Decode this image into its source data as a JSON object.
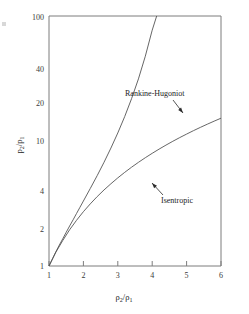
{
  "chart_data": {
    "type": "line",
    "title": "",
    "subtitle": "",
    "xlabel": "ρ₂/ρ₁",
    "ylabel": "p₂/p₁",
    "xscale": "linear",
    "yscale": "log",
    "xlim": [
      1,
      6
    ],
    "ylim": [
      1,
      100
    ],
    "grid": false,
    "legend_position": "inline-annotations",
    "xticks": [
      1,
      2,
      3,
      4,
      5,
      6
    ],
    "xtick_labels": [
      "1",
      "2",
      "3",
      "4",
      "5",
      "6"
    ],
    "yticks": [
      1,
      2,
      4,
      10,
      20,
      40,
      100
    ],
    "ytick_labels": [
      "1",
      "2",
      "4",
      "10",
      "20",
      "40",
      "100"
    ],
    "annotations": [
      {
        "name": "rankine-hugoniot-annotation",
        "text": "Rankine-Hugoniot",
        "points_to_x": 4.05,
        "points_to_y": 19.0
      },
      {
        "name": "isentropic-annotation",
        "text": "Isentropic",
        "points_to_x": 3.05,
        "points_to_y": 4.6
      }
    ],
    "series": [
      {
        "name": "Rankine-Hugoniot",
        "x": [
          1.0,
          1.1,
          1.2,
          1.3,
          1.4,
          1.5,
          1.6,
          1.7,
          1.8,
          1.9,
          2.0,
          2.2,
          2.4,
          2.6,
          2.8,
          3.0,
          3.2,
          3.4,
          3.6,
          3.8,
          4.0,
          4.2,
          4.4,
          4.6,
          4.8,
          5.0,
          5.2,
          5.4,
          5.6,
          5.7,
          5.8
        ],
        "y": [
          1.0,
          1.14,
          1.3,
          1.47,
          1.65,
          1.86,
          2.09,
          2.34,
          2.63,
          2.95,
          3.31,
          4.17,
          5.28,
          6.76,
          8.78,
          11.6,
          15.67,
          21.8,
          31.4,
          47.7,
          77.0,
          115.0,
          180.0,
          300.0,
          560.0,
          1200.0,
          3000.0,
          9000.0,
          40000.0,
          90000.0,
          200000.0
        ],
        "color": "#555555"
      },
      {
        "name": "Isentropic",
        "x": [
          1.0,
          1.2,
          1.4,
          1.6,
          1.8,
          2.0,
          2.2,
          2.4,
          2.6,
          2.8,
          3.0,
          3.2,
          3.4,
          3.6,
          3.8,
          4.0,
          4.2,
          4.4,
          4.6,
          4.8,
          5.0,
          5.2,
          5.4,
          5.6,
          5.8,
          6.0
        ],
        "y": [
          1.0,
          1.29,
          1.6,
          1.95,
          2.32,
          2.72,
          3.14,
          3.59,
          4.06,
          4.55,
          5.07,
          5.61,
          6.17,
          6.75,
          7.35,
          7.97,
          8.61,
          9.27,
          9.95,
          10.65,
          11.36,
          12.1,
          12.85,
          13.62,
          14.41,
          15.22
        ],
        "color": "#555555"
      }
    ]
  },
  "axes": {
    "y_title_numerator": "p",
    "y_title_num_sub": "2",
    "y_title_denominator": "p",
    "y_title_den_sub": "1",
    "x_title_numerator": "ρ",
    "x_title_num_sub": "2",
    "x_title_denominator": "ρ",
    "x_title_den_sub": "1",
    "slash": "/"
  },
  "colors": {
    "frame": "#7d7d7d",
    "curve": "#555555",
    "text": "#1c1c1c",
    "tick_text": "#3a3a3a",
    "background": "#ffffff"
  }
}
